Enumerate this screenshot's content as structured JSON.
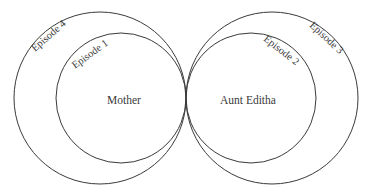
{
  "diagram": {
    "type": "tangent-nested-circles",
    "stroke_color": "#3a3a3a",
    "background": "#ffffff",
    "left_group": {
      "center_label": "Mother",
      "inner_circle": {
        "label": "Episode 1",
        "cx": 121,
        "cy": 98,
        "r": 65
      },
      "outer_circle": {
        "label": "Episode 4",
        "cx": 100,
        "cy": 98,
        "r": 86
      }
    },
    "right_group": {
      "center_label": "Aunt Editha",
      "inner_circle": {
        "label": "Episode 2",
        "cx": 251,
        "cy": 98,
        "r": 65
      },
      "outer_circle": {
        "label": "Episode 3",
        "cx": 272,
        "cy": 98,
        "r": 86
      }
    },
    "tangent_point": {
      "x": 186,
      "y": 98
    }
  }
}
